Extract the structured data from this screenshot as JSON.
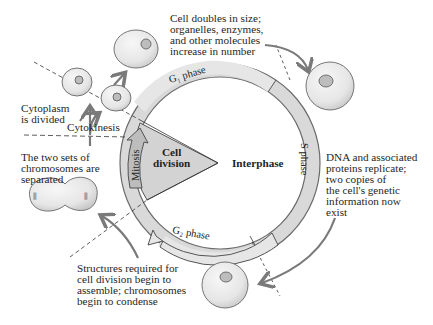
{
  "diagram": {
    "center": {
      "cell_division": "Cell\ndivision",
      "interphase": "Interphase"
    },
    "ring_phases": [
      {
        "id": "g1",
        "label": "G₁ phase"
      },
      {
        "id": "s",
        "label": "S phase"
      },
      {
        "id": "g2",
        "label": "G₂ phase"
      },
      {
        "id": "mitosis",
        "label": "Mitosis"
      }
    ],
    "annotations": {
      "g1": "Cell doubles in size;\norganelles, enzymes,\nand other molecules\nincrease in number",
      "s": "DNA and associated\nproteins replicate;\ntwo copies of\nthe cell's genetic\ninformation now\nexist",
      "g2": "Structures required for\ncell division begin to\nassemble; chromosomes\nbegin to condense",
      "mitosis": "The two sets of\nchromosomes are\nseparated",
      "cytoplasm": "Cytoplasm\nis divided",
      "cytokinesis": "Cytokinesis"
    },
    "colors": {
      "ring": "#d9d9d9",
      "ring_stroke": "#6b6b6b",
      "wedge": "#d3d3d3",
      "arrow": "#7a7a7a",
      "cell_fill": "#e9e9e9",
      "nucleus": "#bdbdbd"
    }
  }
}
